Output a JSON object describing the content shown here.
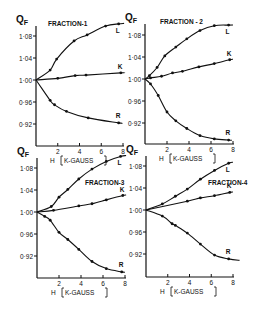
{
  "figure": {
    "ylabel": "Q",
    "ylabel_sub": "F",
    "xlabel_h": "H",
    "xlabel_unit": "K-GAUSS"
  },
  "chart_data": [
    {
      "type": "line",
      "title": "FRACTION-1",
      "xlabel": "H [K-GAUSS]",
      "ylabel": "QF",
      "xlim": [
        0,
        8
      ],
      "ylim": [
        0.88,
        1.1
      ],
      "xticks": [
        "2",
        "4",
        "6",
        "8"
      ],
      "yticks": [
        "1·08",
        "1·04",
        "1·00",
        "0·96",
        "0·92"
      ],
      "grid": false,
      "series": [
        {
          "name": "L",
          "x": [
            0,
            1.3,
            1.9,
            3.5,
            4.7,
            6.4,
            7.6
          ],
          "y": [
            1.0,
            1.018,
            1.038,
            1.071,
            1.082,
            1.098,
            1.102
          ]
        },
        {
          "name": "K",
          "x": [
            0,
            2.0,
            3.6,
            4.6,
            7.8
          ],
          "y": [
            1.0,
            1.003,
            1.008,
            1.009,
            1.013
          ]
        },
        {
          "name": "R",
          "x": [
            0,
            1.3,
            1.7,
            2.8,
            4.8,
            7.6
          ],
          "y": [
            1.0,
            0.963,
            0.955,
            0.943,
            0.931,
            0.922
          ]
        }
      ]
    },
    {
      "type": "line",
      "title": "FRACTION - 2",
      "xlabel": "H [K-GAUSS]",
      "ylabel": "QF",
      "xlim": [
        0,
        8
      ],
      "ylim": [
        0.88,
        1.1
      ],
      "xticks": [
        "2",
        "4",
        "6",
        "8"
      ],
      "yticks": [
        "1·08",
        "1·04",
        "1·00",
        "0·96",
        "0·92"
      ],
      "grid": false,
      "series": [
        {
          "name": "L",
          "x": [
            0,
            0.4,
            1.1,
            1.8,
            2.8,
            3.8,
            5.0,
            6.3,
            7.6
          ],
          "y": [
            1.0,
            1.006,
            1.021,
            1.042,
            1.058,
            1.073,
            1.088,
            1.097,
            1.098
          ]
        },
        {
          "name": "K",
          "x": [
            0,
            0.5,
            1.5,
            2.5,
            3.4,
            4.9,
            6.3,
            7.7
          ],
          "y": [
            1.0,
            1.002,
            1.005,
            1.011,
            1.014,
            1.022,
            1.028,
            1.035
          ]
        },
        {
          "name": "R",
          "x": [
            0,
            0.5,
            1.2,
            2.0,
            2.8,
            3.8,
            5.0,
            6.3,
            7.6
          ],
          "y": [
            1.0,
            0.991,
            0.97,
            0.94,
            0.924,
            0.91,
            0.897,
            0.891,
            0.889
          ]
        }
      ]
    },
    {
      "type": "line",
      "title": "FRACTION-3",
      "xlabel": "H [K-GAUSS]",
      "ylabel": "QF",
      "xlim": [
        0,
        8
      ],
      "ylim": [
        0.88,
        1.1
      ],
      "xticks": [
        "2",
        "4",
        "6",
        "8"
      ],
      "yticks": [
        "1·08",
        "1·04",
        "1·00",
        "0·96",
        "0·92"
      ],
      "grid": false,
      "series": [
        {
          "name": "L",
          "x": [
            0,
            1.3,
            2.0,
            2.8,
            3.8,
            5.0,
            6.3,
            7.6
          ],
          "y": [
            1.0,
            1.01,
            1.027,
            1.041,
            1.06,
            1.078,
            1.092,
            1.101
          ]
        },
        {
          "name": "K",
          "x": [
            0,
            1.5,
            3.8,
            5.0,
            6.3,
            7.8
          ],
          "y": [
            1.0,
            1.003,
            1.011,
            1.015,
            1.022,
            1.03
          ]
        },
        {
          "name": "R",
          "x": [
            0,
            0.7,
            1.2,
            2.0,
            2.8,
            3.8,
            5.0,
            6.3,
            7.7
          ],
          "y": [
            1.0,
            0.992,
            0.985,
            0.963,
            0.95,
            0.932,
            0.91,
            0.897,
            0.891
          ]
        }
      ]
    },
    {
      "type": "line",
      "title": "FRACTION-4",
      "xlabel": "H [K-GAUSS]",
      "ylabel": "QF",
      "xlim": [
        0,
        8
      ],
      "ylim": [
        0.88,
        1.1
      ],
      "xticks": [
        "2",
        "4",
        "6",
        "8"
      ],
      "yticks": [
        "1·08",
        "1·04",
        "1·00",
        "0·96",
        "0·92"
      ],
      "grid": false,
      "series": [
        {
          "name": "L",
          "x": [
            0,
            1.5,
            2.7,
            3.8,
            5.0,
            6.3,
            7.6
          ],
          "y": [
            1.0,
            1.011,
            1.025,
            1.038,
            1.056,
            1.072,
            1.085
          ]
        },
        {
          "name": "K",
          "x": [
            0,
            3.8,
            5.0,
            6.3,
            7.7
          ],
          "y": [
            1.0,
            1.016,
            1.022,
            1.026,
            1.032
          ]
        },
        {
          "name": "R",
          "x": [
            0,
            1.5,
            2.4,
            2.7,
            3.8,
            5.0,
            6.3,
            7.6
          ],
          "y": [
            1.0,
            0.989,
            0.975,
            0.972,
            0.958,
            0.938,
            0.918,
            0.911
          ]
        }
      ]
    }
  ],
  "layout": [
    {
      "ox": 36,
      "x8": 123,
      "y100": 80,
      "ytop": 26,
      "ybot": 146,
      "title_x": 48,
      "title_y": 26,
      "show_xlabel": true,
      "curve_end": 8.1,
      "r_end": 7.9
    },
    {
      "ox": 145,
      "x8": 233,
      "y100": 79,
      "ytop": 24,
      "ybot": 144,
      "title_x": 160,
      "title_y": 24,
      "show_xlabel": true,
      "curve_end": 8.0,
      "r_end": 7.9
    },
    {
      "ox": 37,
      "x8": 125,
      "y100": 212,
      "ytop": 158,
      "ybot": 278,
      "title_x": 85,
      "title_y": 185,
      "show_xlabel": true,
      "curve_end": 8.1,
      "r_end": 8.0
    },
    {
      "ox": 146,
      "x8": 233,
      "y100": 210,
      "ytop": 156,
      "ybot": 277,
      "title_x": 208,
      "title_y": 185,
      "show_xlabel": true,
      "curve_end": 8.0,
      "r_end": 8.6
    }
  ]
}
